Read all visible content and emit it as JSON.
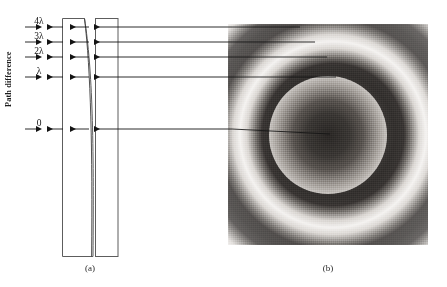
{
  "figure": {
    "axis_label": "Path difference",
    "panels": [
      {
        "id": "a",
        "caption": "(a)"
      },
      {
        "id": "b",
        "caption": "(b)"
      }
    ]
  },
  "path_difference_orders": [
    {
      "label": "4λ",
      "value": "4λ",
      "order": 4,
      "y": 27
    },
    {
      "label": "3λ",
      "value": "3λ",
      "order": 3,
      "y": 42
    },
    {
      "label": "2λ",
      "value": "2λ",
      "order": 2,
      "y": 57
    },
    {
      "label": "λ",
      "value": "λ",
      "order": 1,
      "y": 77
    },
    {
      "label": "0",
      "value": "0",
      "order": 0,
      "y": 129
    }
  ],
  "diagram": {
    "plate_left_name": "curved-glass-plate",
    "plate_right_name": "flat-glass-plate",
    "ray_count": 5,
    "pattern_name": "newtons-rings-interference-pattern",
    "pattern_center": {
      "x": 328,
      "y": 135
    },
    "ring_count": 9
  },
  "colors": {
    "line": "#1a1a1a",
    "plate_outline": "#5a5a5a",
    "fringe_dark": "#2d2a28",
    "fringe_light": "#f4f2f0",
    "background": "#ffffff"
  }
}
